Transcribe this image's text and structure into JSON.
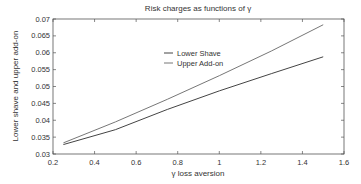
{
  "chart_data": {
    "type": "line",
    "title": "Risk charges as functions of γ",
    "xlabel": "γ loss aversion",
    "ylabel": "Lower shave and upper add-on",
    "xlim": [
      0.2,
      1.6
    ],
    "ylim": [
      0.03,
      0.07
    ],
    "xticks": [
      0.2,
      0.4,
      0.6,
      0.8,
      1,
      1.2,
      1.4,
      1.6
    ],
    "xtick_labels": [
      "0.2",
      "0.4",
      "0.6",
      "0.8",
      "1",
      "1.2",
      "1.4",
      "1.6"
    ],
    "yticks": [
      0.03,
      0.035,
      0.04,
      0.045,
      0.05,
      0.055,
      0.06,
      0.065,
      0.07
    ],
    "ytick_labels": [
      "0.03",
      "0.035",
      "0.04",
      "0.045",
      "0.05",
      "0.055",
      "0.06",
      "0.065",
      "0.07"
    ],
    "grid": false,
    "legend_position": "upper-center",
    "x": [
      0.25,
      0.5,
      0.75,
      1.0,
      1.25,
      1.5
    ],
    "series": [
      {
        "name": "Lower Shave",
        "color": "#444444",
        "values": [
          0.0328,
          0.0372,
          0.0432,
          0.0487,
          0.0538,
          0.0588
        ]
      },
      {
        "name": "Upper Add-on",
        "color": "#777777",
        "values": [
          0.0333,
          0.0395,
          0.0462,
          0.0532,
          0.0605,
          0.0683
        ]
      }
    ]
  }
}
